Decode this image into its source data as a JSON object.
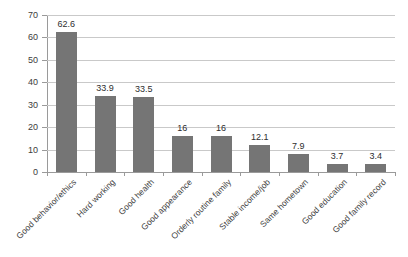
{
  "chart_data": {
    "type": "bar",
    "title": "",
    "subtitle": "",
    "xlabel": "",
    "ylabel": "",
    "ylim": [
      0,
      70
    ],
    "ytick_step": 10,
    "yticks": [
      0,
      10,
      20,
      30,
      40,
      50,
      60,
      70
    ],
    "ytick_labels": [
      "0",
      "10",
      "20",
      "30",
      "40",
      "50",
      "60",
      "70"
    ],
    "grid": true,
    "grid_axis": "y",
    "legend": false,
    "legend_position": "none",
    "orientation": "vertical",
    "categories": [
      "Good behavior/ethics",
      "Hard working",
      "Good health",
      "Good appearance",
      "Orderly routine family",
      "Stable income/job",
      "Same hometown",
      "Good education",
      "Good family record"
    ],
    "values": [
      62.6,
      33.9,
      33.5,
      16,
      16,
      12.1,
      7.9,
      3.7,
      3.4
    ],
    "value_labels": [
      "62.6",
      "33.9",
      "33.5",
      "16",
      "16",
      "12.1",
      "7.9",
      "3.7",
      "3.4"
    ],
    "show_data_labels": true,
    "series": [
      {
        "name": "",
        "values": [
          62.6,
          33.9,
          33.5,
          16,
          16,
          12.1,
          7.9,
          3.7,
          3.4
        ]
      }
    ]
  },
  "colors": {
    "bar": "#757575",
    "grid": "#c9c9c9",
    "axis": "#9a9a9a",
    "text": "#3c3c3c",
    "background": "#ffffff"
  }
}
